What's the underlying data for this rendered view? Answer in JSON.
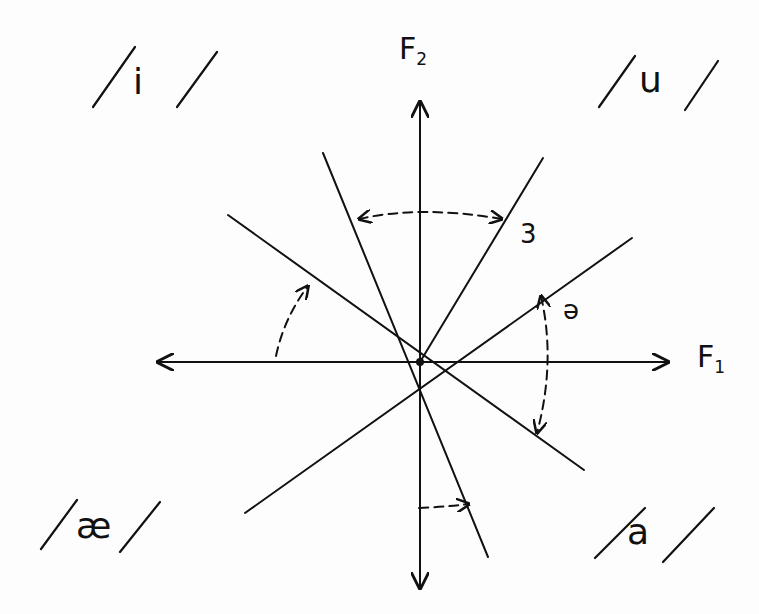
{
  "diagram": {
    "axes": {
      "f1": {
        "label": "F",
        "sub": "1"
      },
      "f2": {
        "label": "F",
        "sub": "2"
      }
    },
    "vowels": [
      {
        "quadrant": "top-left",
        "symbol": "i",
        "text": "/ i /"
      },
      {
        "quadrant": "top-right",
        "symbol": "u",
        "text": "/ u /"
      },
      {
        "quadrant": "bottom-left",
        "symbol": "æ",
        "text": "/ æ /"
      },
      {
        "quadrant": "bottom-right",
        "symbol": "a",
        "text": "/ a /"
      }
    ],
    "rotation_labels": {
      "upper": "3",
      "right": "ə"
    },
    "colors": {
      "ink": "#111111",
      "paper": "#fdfdfd"
    }
  }
}
